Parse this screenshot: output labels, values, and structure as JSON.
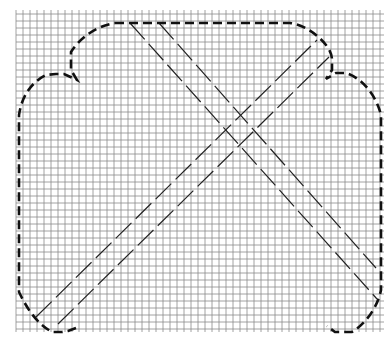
{
  "diagram": {
    "type": "pattern-template",
    "grid": {
      "x_start": 16,
      "x_end": 384,
      "y_start": 14,
      "y_end": 332,
      "cell_size": 7,
      "line_color": "#8a8a8a"
    },
    "outline": {
      "style": "bold-dashed",
      "color": "#111111",
      "path": "M115,23 L290,23 C305,25 318,35 326,45 C330,50 332,55 332,60 L332,70 L326,79 L336,73 L346,73 C362,78 376,95 381,115 L381,290 C378,305 368,322 352,332 L335,332 L327,326 M76,328 L68,331 L62,332 L52,332 C40,325 30,315 19,292 L19,115 C22,95 32,82 46,75 L56,74 L64,74 L77,80 L71,70 L71,52 C80,38 96,26 115,23"
    },
    "diagonals": {
      "style": "thin-dashed",
      "color": "#222222",
      "lines": [
        {
          "name": "down-right-outer",
          "x1": 130,
          "y1": 23,
          "x2": 377,
          "y2": 299
        },
        {
          "name": "down-right-inner",
          "x1": 159,
          "y1": 23,
          "x2": 376,
          "y2": 268
        },
        {
          "name": "up-right-outer",
          "x1": 36,
          "y1": 317,
          "x2": 317,
          "y2": 40
        },
        {
          "name": "up-right-inner",
          "x1": 58,
          "y1": 324,
          "x2": 329,
          "y2": 57
        }
      ]
    }
  }
}
